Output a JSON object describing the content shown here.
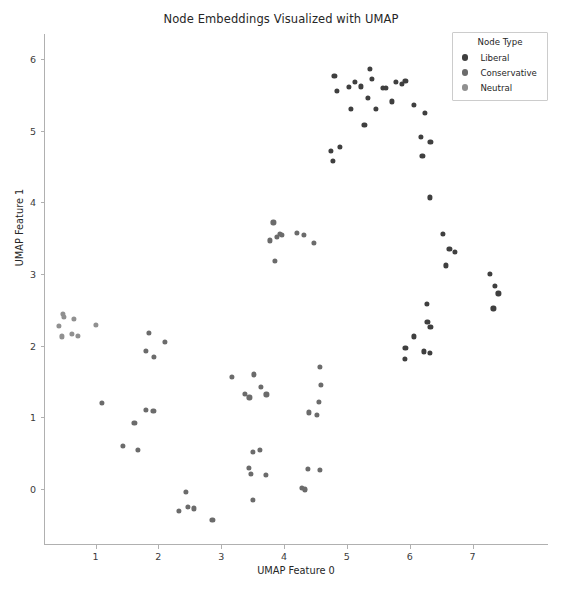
{
  "chart_data": {
    "type": "scatter",
    "title": "Node Embeddings Visualized with UMAP",
    "xlabel": "UMAP Feature 0",
    "ylabel": "UMAP Feature 1",
    "xlim": [
      0.18,
      8.2
    ],
    "ylim": [
      -0.78,
      6.35
    ],
    "xticks": [
      1,
      2,
      3,
      4,
      5,
      6,
      7
    ],
    "yticks": [
      0,
      1,
      2,
      3,
      4,
      5,
      6
    ],
    "grid": false,
    "legend": {
      "title": "Node Type",
      "position": "upper right",
      "entries": [
        {
          "name": "Liberal",
          "color": "#3f3f3f"
        },
        {
          "name": "Conservative",
          "color": "#6b6b6b"
        },
        {
          "name": "Neutral",
          "color": "#909090"
        }
      ]
    },
    "series": [
      {
        "name": "Liberal",
        "color": "#3f3f3f",
        "points": [
          [
            4.8,
            5.77
          ],
          [
            4.84,
            5.56
          ],
          [
            5.03,
            5.61
          ],
          [
            5.07,
            5.3
          ],
          [
            5.13,
            5.68
          ],
          [
            5.22,
            5.62
          ],
          [
            5.28,
            5.08
          ],
          [
            5.33,
            5.46
          ],
          [
            5.37,
            5.86
          ],
          [
            5.4,
            5.72
          ],
          [
            5.46,
            5.3
          ],
          [
            5.57,
            5.6
          ],
          [
            5.62,
            5.6
          ],
          [
            5.71,
            5.41
          ],
          [
            5.78,
            5.68
          ],
          [
            5.88,
            5.65
          ],
          [
            5.93,
            5.7
          ],
          [
            6.06,
            5.36
          ],
          [
            6.18,
            4.91
          ],
          [
            6.24,
            5.25
          ],
          [
            6.33,
            4.85
          ],
          [
            6.2,
            4.65
          ],
          [
            4.74,
            4.72
          ],
          [
            4.78,
            4.58
          ],
          [
            4.89,
            4.78
          ],
          [
            6.32,
            4.07
          ],
          [
            6.53,
            3.56
          ],
          [
            6.63,
            3.35
          ],
          [
            6.72,
            3.31
          ],
          [
            6.58,
            3.12
          ],
          [
            7.28,
            3.0
          ],
          [
            7.35,
            2.83
          ],
          [
            7.41,
            2.73
          ],
          [
            7.33,
            2.52
          ],
          [
            6.27,
            2.58
          ],
          [
            6.28,
            2.33
          ],
          [
            6.33,
            2.26
          ],
          [
            6.07,
            2.13
          ],
          [
            5.93,
            1.97
          ],
          [
            5.92,
            1.82
          ],
          [
            6.23,
            1.92
          ],
          [
            6.32,
            1.9
          ]
        ]
      },
      {
        "name": "Conservative",
        "color": "#6b6b6b",
        "points": [
          [
            3.83,
            3.72
          ],
          [
            3.78,
            3.47
          ],
          [
            3.88,
            3.52
          ],
          [
            3.94,
            3.56
          ],
          [
            3.96,
            3.55
          ],
          [
            4.2,
            3.58
          ],
          [
            4.32,
            3.55
          ],
          [
            4.47,
            3.44
          ],
          [
            3.85,
            3.18
          ],
          [
            3.17,
            1.56
          ],
          [
            3.52,
            1.6
          ],
          [
            3.63,
            1.43
          ],
          [
            3.38,
            1.33
          ],
          [
            3.45,
            1.28
          ],
          [
            3.72,
            1.32
          ],
          [
            4.57,
            1.7
          ],
          [
            4.58,
            1.45
          ],
          [
            4.56,
            1.22
          ],
          [
            4.4,
            1.07
          ],
          [
            4.52,
            1.04
          ],
          [
            1.1,
            1.2
          ],
          [
            1.44,
            0.6
          ],
          [
            1.62,
            0.92
          ],
          [
            1.68,
            0.55
          ],
          [
            1.8,
            1.1
          ],
          [
            1.92,
            1.09
          ],
          [
            1.8,
            1.93
          ],
          [
            1.85,
            2.18
          ],
          [
            1.93,
            1.84
          ],
          [
            2.1,
            2.05
          ],
          [
            3.5,
            0.52
          ],
          [
            3.62,
            0.55
          ],
          [
            3.44,
            0.3
          ],
          [
            3.47,
            0.21
          ],
          [
            3.71,
            0.2
          ],
          [
            3.5,
            -0.15
          ],
          [
            4.38,
            0.28
          ],
          [
            4.57,
            0.27
          ],
          [
            4.28,
            0.02
          ],
          [
            4.33,
            -0.01
          ],
          [
            4.33,
            0.0
          ],
          [
            2.44,
            -0.04
          ],
          [
            2.47,
            -0.25
          ],
          [
            2.33,
            -0.3
          ],
          [
            2.57,
            -0.27
          ],
          [
            2.86,
            -0.43
          ]
        ]
      },
      {
        "name": "Neutral",
        "color": "#909090",
        "points": [
          [
            0.48,
            2.44
          ],
          [
            0.5,
            2.4
          ],
          [
            0.42,
            2.28
          ],
          [
            0.47,
            2.13
          ],
          [
            0.66,
            2.38
          ],
          [
            0.62,
            2.17
          ],
          [
            0.72,
            2.14
          ],
          [
            1.0,
            2.29
          ]
        ]
      }
    ]
  }
}
